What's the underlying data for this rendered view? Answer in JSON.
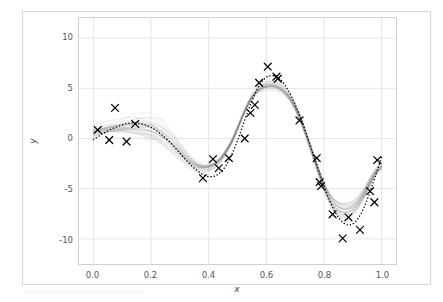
{
  "figure": {
    "background": "#ffffff",
    "frame_color": "#d8d8d8",
    "axes_edge_color": "#cfcfcf",
    "grid_color": "#e3e3e8"
  },
  "chart_data": {
    "type": "line",
    "title": "",
    "subtitle": "",
    "xlabel": "x",
    "ylabel": "y",
    "xlim": [
      -0.05,
      1.05
    ],
    "ylim": [
      -12.5,
      12.0
    ],
    "xticks": [
      0.0,
      0.2,
      0.4,
      0.6,
      0.8,
      1.0
    ],
    "xticklabels": [
      "0.0",
      "0.2",
      "0.4",
      "0.6",
      "0.8",
      "1.0"
    ],
    "yticks": [
      10,
      5,
      0,
      -5,
      -10
    ],
    "yticklabels": [
      "10",
      "5",
      "0",
      "-5",
      "-10"
    ],
    "grid": true,
    "legend": "none",
    "annotations": [],
    "series": [
      {
        "name": "true-function",
        "style": "dotted",
        "color": "#000000",
        "linewidth": 1.4,
        "x": [
          0.0,
          0.02,
          0.04,
          0.06,
          0.08,
          0.1,
          0.12,
          0.14,
          0.16,
          0.18,
          0.2,
          0.22,
          0.24,
          0.26,
          0.28,
          0.3,
          0.32,
          0.34,
          0.36,
          0.38,
          0.4,
          0.42,
          0.44,
          0.46,
          0.48,
          0.5,
          0.52,
          0.54,
          0.56,
          0.58,
          0.6,
          0.62,
          0.64,
          0.66,
          0.68,
          0.7,
          0.72,
          0.74,
          0.76,
          0.78,
          0.8,
          0.82,
          0.84,
          0.86,
          0.88,
          0.9,
          0.92,
          0.94,
          0.96,
          0.98,
          1.0
        ],
        "y": [
          -0.1,
          0.25,
          0.6,
          0.9,
          1.15,
          1.35,
          1.5,
          1.55,
          1.5,
          1.35,
          1.1,
          0.75,
          0.3,
          -0.2,
          -0.8,
          -1.45,
          -2.1,
          -2.7,
          -3.2,
          -3.6,
          -3.8,
          -3.75,
          -3.4,
          -2.7,
          -1.6,
          -0.2,
          1.4,
          3.0,
          4.4,
          5.5,
          6.1,
          6.25,
          6.1,
          5.5,
          4.6,
          3.4,
          2.0,
          0.4,
          -1.3,
          -3.0,
          -4.7,
          -6.2,
          -7.4,
          -8.2,
          -8.6,
          -8.5,
          -7.9,
          -6.8,
          -5.3,
          -3.6,
          -1.8
        ]
      },
      {
        "name": "posterior-sample-ensemble",
        "style": "solid",
        "color": "#808080",
        "alpha": 0.12,
        "n_samples": 40,
        "description": "ensemble of posterior predictive sample curves, spread widest between x=0.15 and x=0.40 and between x=0.80 and x=0.95",
        "mean_x": [
          0.0,
          0.02,
          0.04,
          0.06,
          0.08,
          0.1,
          0.12,
          0.14,
          0.16,
          0.18,
          0.2,
          0.22,
          0.24,
          0.26,
          0.28,
          0.3,
          0.32,
          0.34,
          0.36,
          0.38,
          0.4,
          0.42,
          0.44,
          0.46,
          0.48,
          0.5,
          0.52,
          0.54,
          0.56,
          0.58,
          0.6,
          0.62,
          0.64,
          0.66,
          0.68,
          0.7,
          0.72,
          0.74,
          0.76,
          0.78,
          0.8,
          0.82,
          0.84,
          0.86,
          0.88,
          0.9,
          0.92,
          0.94,
          0.96,
          0.98,
          1.0
        ],
        "mean_y": [
          0.7,
          0.85,
          0.95,
          1.05,
          1.1,
          1.15,
          1.2,
          1.2,
          1.15,
          1.05,
          0.9,
          0.65,
          0.3,
          -0.15,
          -0.7,
          -1.3,
          -1.9,
          -2.4,
          -2.75,
          -2.9,
          -2.85,
          -2.6,
          -2.1,
          -1.3,
          -0.3,
          1.0,
          2.4,
          3.6,
          4.5,
          5.0,
          5.25,
          5.3,
          5.15,
          4.75,
          4.1,
          3.1,
          1.8,
          0.2,
          -1.5,
          -3.2,
          -4.8,
          -6.0,
          -6.8,
          -7.2,
          -7.25,
          -7.0,
          -6.4,
          -5.5,
          -4.4,
          -3.4,
          -2.8
        ],
        "band_halfwidth": [
          0.9,
          0.85,
          0.8,
          0.8,
          0.85,
          0.95,
          1.1,
          1.25,
          1.4,
          1.55,
          1.7,
          1.75,
          1.7,
          1.6,
          1.45,
          1.25,
          1.05,
          0.85,
          0.7,
          0.6,
          0.55,
          0.5,
          0.45,
          0.4,
          0.35,
          0.32,
          0.3,
          0.32,
          0.35,
          0.4,
          0.45,
          0.48,
          0.5,
          0.5,
          0.5,
          0.5,
          0.5,
          0.5,
          0.55,
          0.6,
          0.7,
          0.85,
          1.0,
          1.1,
          1.15,
          1.1,
          1.0,
          0.9,
          0.8,
          0.75,
          0.75
        ]
      }
    ],
    "scatter": {
      "name": "observations",
      "marker": "x",
      "color": "#000000",
      "size": 7,
      "points": [
        {
          "x": 0.015,
          "y": 0.85
        },
        {
          "x": 0.055,
          "y": -0.15
        },
        {
          "x": 0.075,
          "y": 3.05
        },
        {
          "x": 0.115,
          "y": -0.3
        },
        {
          "x": 0.145,
          "y": 1.45
        },
        {
          "x": 0.38,
          "y": -3.95
        },
        {
          "x": 0.415,
          "y": -2.05
        },
        {
          "x": 0.435,
          "y": -2.95
        },
        {
          "x": 0.47,
          "y": -1.95
        },
        {
          "x": 0.525,
          "y": 0.0
        },
        {
          "x": 0.545,
          "y": 2.55
        },
        {
          "x": 0.56,
          "y": 3.35
        },
        {
          "x": 0.575,
          "y": 5.55
        },
        {
          "x": 0.605,
          "y": 7.15
        },
        {
          "x": 0.635,
          "y": 6.15
        },
        {
          "x": 0.64,
          "y": 5.95
        },
        {
          "x": 0.715,
          "y": 1.8
        },
        {
          "x": 0.775,
          "y": -1.95
        },
        {
          "x": 0.785,
          "y": -4.35
        },
        {
          "x": 0.79,
          "y": -4.75
        },
        {
          "x": 0.83,
          "y": -7.55
        },
        {
          "x": 0.865,
          "y": -9.95
        },
        {
          "x": 0.885,
          "y": -7.85
        },
        {
          "x": 0.925,
          "y": -9.1
        },
        {
          "x": 0.96,
          "y": -5.25
        },
        {
          "x": 0.975,
          "y": -6.35
        },
        {
          "x": 0.985,
          "y": -2.15
        }
      ]
    }
  }
}
